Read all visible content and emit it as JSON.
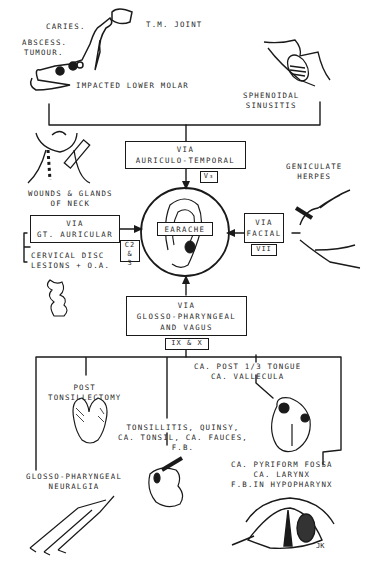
{
  "diagram": {
    "center": {
      "label": "EARACHE"
    },
    "routes": {
      "auriculo_temporal": {
        "line1": "VIA",
        "line2": "AURICULO-TEMPORAL",
        "nerve": "V₃"
      },
      "gt_auricular": {
        "line1": "VIA",
        "line2": "GT. AURICULAR",
        "nerve_line1": "C2 &",
        "nerve_line2": "3"
      },
      "facial": {
        "line1": "VIA",
        "line2": "FACIAL",
        "nerve": "VII"
      },
      "glosso_pharyngeal_vagus": {
        "line1": "VIA",
        "line2": "GLOSSO-PHARYNGEAL",
        "line3": "AND VAGUS",
        "nerve": "IX & X"
      }
    },
    "causes": {
      "caries": "CARIES.",
      "abscess": "ABSCESS.",
      "tumour": "TUMOUR.",
      "tm_joint": "T.M. JOINT",
      "impacted_molar": "IMPACTED LOWER MOLAR",
      "sphenoidal_line1": "SPHENOIDAL",
      "sphenoidal_line2": "SINUSITIS",
      "wounds_line1": "WOUNDS & GLANDS",
      "wounds_line2": "OF NECK",
      "cervical_line1": "CERVICAL DISC",
      "cervical_line2": "LESIONS + O.A.",
      "geniculate_line1": "GENICULATE",
      "geniculate_line2": "HERPES",
      "post_tonsil_line1": "POST",
      "post_tonsil_line2": "TONSILLECTOMY",
      "tonsillitis_line1": "TONSILLITIS, QUINSY,",
      "tonsillitis_line2": "CA. TONSIL, CA. FAUCES,",
      "tonsillitis_line3": "F.B.",
      "tongue_line1": "CA. POST 1/3 TONGUE",
      "tongue_line2": "CA. VALLECULA",
      "pyriform_line1": "CA. PYRIFORM FOSSA",
      "pyriform_line2": "CA. LARYNX",
      "pyriform_line3": "F.B.IN HYPOPHARYNX",
      "neuralgia_line1": "GLOSSO-PHARYNGEAL",
      "neuralgia_line2": "NEURALGIA"
    },
    "signature": "JK"
  }
}
